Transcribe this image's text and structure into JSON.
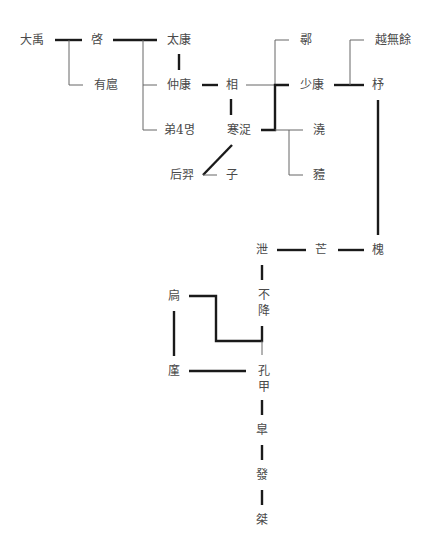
{
  "diagram": {
    "title": "",
    "type": "genealogy-tree",
    "nodes": {
      "dayu": "大禹",
      "qi": "啓",
      "youhu": "有扈",
      "taikang": "太康",
      "zhongkang": "仲康",
      "brothers4": "弟4명",
      "xiang": "相",
      "hanzhuo": "寒浞",
      "houyi": "后羿",
      "zi": "子",
      "xun": "鄩",
      "shaokang": "少康",
      "ao": "澆",
      "yi": "豷",
      "yuewuyu": "越無餘",
      "zhu": "杼",
      "huai": "槐",
      "mang": "芒",
      "xie": "泄",
      "bujiang": "不降",
      "jiong": "扃",
      "jin": "廑",
      "kongjia": "孔甲",
      "gao": "皐",
      "fa": "發",
      "jie": "桀"
    },
    "colors": {
      "thick_line": "#1a1a1a",
      "thin_line": "#666666",
      "text": "#4a4a4a",
      "background": "#ffffff"
    }
  }
}
